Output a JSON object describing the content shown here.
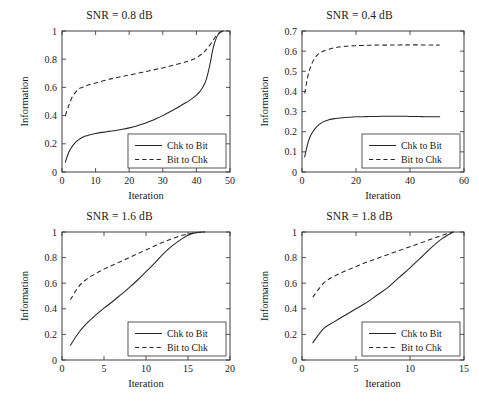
{
  "figure": {
    "layout": "2x2 grid of line plots",
    "panel_count": 4
  },
  "chart_data": [
    {
      "type": "line",
      "title": "SNR = 0.8 dB",
      "xlabel": "Iteration",
      "ylabel": "Information",
      "xlim": [
        0,
        50
      ],
      "ylim": [
        0,
        1
      ],
      "xticks": [
        0,
        10,
        20,
        30,
        40,
        50
      ],
      "yticks": [
        0,
        0.2,
        0.4,
        0.6,
        0.8,
        1
      ],
      "grid": false,
      "legend_position": "lower right",
      "series": [
        {
          "name": "Chk to Bit",
          "style": "solid",
          "x": [
            1,
            2,
            3,
            4,
            5,
            6,
            7,
            8,
            9,
            10,
            12,
            14,
            16,
            18,
            20,
            22,
            24,
            26,
            28,
            30,
            32,
            34,
            36,
            38,
            40,
            41,
            42,
            43,
            44,
            45,
            46,
            47,
            48
          ],
          "y": [
            0.07,
            0.14,
            0.18,
            0.21,
            0.23,
            0.245,
            0.255,
            0.262,
            0.268,
            0.273,
            0.281,
            0.288,
            0.295,
            0.303,
            0.313,
            0.325,
            0.34,
            0.358,
            0.378,
            0.4,
            0.425,
            0.452,
            0.48,
            0.508,
            0.545,
            0.57,
            0.605,
            0.66,
            0.76,
            0.88,
            0.955,
            0.99,
            1.0
          ]
        },
        {
          "name": "Bit to Chk",
          "style": "dashed",
          "x": [
            1,
            2,
            3,
            4,
            5,
            6,
            7,
            8,
            10,
            12,
            14,
            16,
            18,
            20,
            24,
            28,
            32,
            36,
            38,
            40,
            42,
            43,
            44,
            45,
            46,
            47,
            48
          ],
          "y": [
            0.4,
            0.47,
            0.53,
            0.565,
            0.59,
            0.6,
            0.61,
            0.618,
            0.632,
            0.645,
            0.658,
            0.668,
            0.678,
            0.688,
            0.708,
            0.728,
            0.75,
            0.775,
            0.79,
            0.81,
            0.845,
            0.87,
            0.9,
            0.935,
            0.97,
            0.99,
            1.0
          ]
        }
      ]
    },
    {
      "type": "line",
      "title": "SNR = 0.4 dB",
      "xlabel": "Iteration",
      "ylabel": "Information",
      "xlim": [
        0,
        60
      ],
      "ylim": [
        0,
        0.7
      ],
      "xticks": [
        0,
        20,
        40,
        60
      ],
      "yticks": [
        0,
        0.1,
        0.2,
        0.3,
        0.4,
        0.5,
        0.6,
        0.7
      ],
      "grid": false,
      "legend_position": "lower right",
      "series": [
        {
          "name": "Chk to Bit",
          "style": "solid",
          "x": [
            1,
            2,
            3,
            4,
            5,
            6,
            7,
            8,
            10,
            12,
            14,
            16,
            18,
            20,
            24,
            28,
            32,
            36,
            40,
            44,
            48,
            51
          ],
          "y": [
            0.075,
            0.135,
            0.175,
            0.2,
            0.218,
            0.232,
            0.242,
            0.25,
            0.259,
            0.265,
            0.268,
            0.271,
            0.272,
            0.274,
            0.275,
            0.276,
            0.277,
            0.277,
            0.276,
            0.275,
            0.274,
            0.274
          ]
        },
        {
          "name": "Bit to Chk",
          "style": "dashed",
          "x": [
            1,
            2,
            3,
            4,
            5,
            6,
            7,
            8,
            10,
            12,
            14,
            16,
            18,
            20,
            24,
            28,
            32,
            36,
            40,
            44,
            48,
            51
          ],
          "y": [
            0.39,
            0.465,
            0.515,
            0.548,
            0.57,
            0.585,
            0.594,
            0.601,
            0.61,
            0.617,
            0.621,
            0.624,
            0.626,
            0.627,
            0.629,
            0.63,
            0.63,
            0.631,
            0.631,
            0.631,
            0.63,
            0.63
          ]
        }
      ]
    },
    {
      "type": "line",
      "title": "SNR = 1.6 dB",
      "xlabel": "Iteration",
      "ylabel": "Information",
      "xlim": [
        0,
        20
      ],
      "ylim": [
        0,
        1
      ],
      "xticks": [
        0,
        5,
        10,
        15,
        20
      ],
      "yticks": [
        0,
        0.2,
        0.4,
        0.6,
        0.8,
        1
      ],
      "grid": false,
      "legend_position": "lower right",
      "series": [
        {
          "name": "Chk to Bit",
          "style": "solid",
          "x": [
            1,
            2,
            3,
            4,
            5,
            6,
            7,
            8,
            9,
            10,
            11,
            12,
            13,
            14,
            15,
            16,
            17
          ],
          "y": [
            0.115,
            0.215,
            0.29,
            0.35,
            0.405,
            0.455,
            0.51,
            0.565,
            0.625,
            0.69,
            0.755,
            0.825,
            0.885,
            0.935,
            0.975,
            0.995,
            1.0
          ]
        },
        {
          "name": "Bit to Chk",
          "style": "dashed",
          "x": [
            1,
            2,
            3,
            4,
            5,
            6,
            7,
            8,
            9,
            10,
            11,
            12,
            13,
            14,
            15,
            16,
            17
          ],
          "y": [
            0.47,
            0.575,
            0.635,
            0.675,
            0.71,
            0.74,
            0.77,
            0.8,
            0.83,
            0.86,
            0.89,
            0.92,
            0.945,
            0.968,
            0.985,
            0.996,
            1.0
          ]
        }
      ]
    },
    {
      "type": "line",
      "title": "SNR = 1.8 dB",
      "xlabel": "Iteration",
      "ylabel": "Information",
      "xlim": [
        0,
        15
      ],
      "ylim": [
        0,
        1
      ],
      "xticks": [
        0,
        5,
        10,
        15
      ],
      "yticks": [
        0,
        0.2,
        0.4,
        0.6,
        0.8,
        1
      ],
      "grid": false,
      "legend_position": "lower right",
      "series": [
        {
          "name": "Chk to Bit",
          "style": "solid",
          "x": [
            1,
            2,
            3,
            4,
            5,
            6,
            7,
            8,
            9,
            10,
            11,
            12,
            13,
            14
          ],
          "y": [
            0.135,
            0.245,
            0.3,
            0.35,
            0.4,
            0.45,
            0.51,
            0.57,
            0.645,
            0.72,
            0.8,
            0.88,
            0.95,
            1.0
          ]
        },
        {
          "name": "Bit to Chk",
          "style": "dashed",
          "x": [
            1,
            2,
            3,
            4,
            5,
            6,
            7,
            8,
            9,
            10,
            11,
            12,
            13,
            14
          ],
          "y": [
            0.49,
            0.6,
            0.655,
            0.695,
            0.73,
            0.765,
            0.795,
            0.825,
            0.855,
            0.885,
            0.915,
            0.945,
            0.975,
            1.0
          ]
        }
      ]
    }
  ]
}
